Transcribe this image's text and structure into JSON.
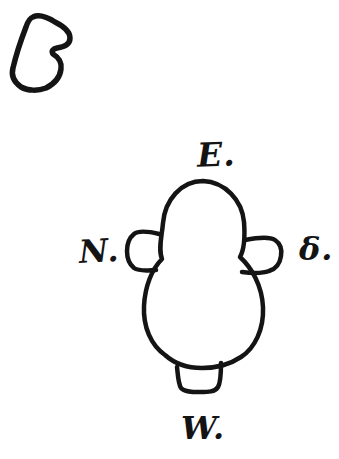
{
  "figure": {
    "type": "hand-drawn plan sketch",
    "ink_color": "#141414",
    "background_color": "#ffffff"
  },
  "labels": {
    "east": "E.",
    "north": "N.",
    "south": "δ.",
    "west": "W."
  },
  "shapes": [
    {
      "name": "small-irregular-outline",
      "description": "small tilted B-shaped closed outline at top left"
    },
    {
      "name": "plan-body-outline",
      "description": "keyhole-shaped plan: round head merging into a larger oval body"
    },
    {
      "name": "north-tab",
      "description": "rounded tab projecting from the left side"
    },
    {
      "name": "south-tab",
      "description": "rounded tab projecting from the right side"
    },
    {
      "name": "west-tab",
      "description": "small rounded tab projecting from the bottom"
    }
  ]
}
